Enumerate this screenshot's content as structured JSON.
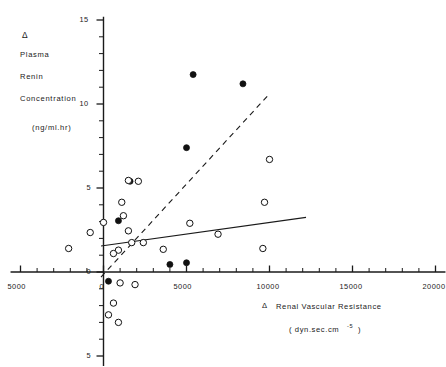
{
  "figure": {
    "background": "#ffffff",
    "ink": "#1a1a1a",
    "y_axis_title_lines": [
      "Δ",
      "Plasma",
      "Renin",
      "Concentration"
    ],
    "y_axis_units": "(ng/ml.hr)",
    "x_axis_title_symbol": "Δ",
    "x_axis_title": "Renal Vascular Resistance",
    "x_axis_units_prefix": "( dyn.sec.cm",
    "x_axis_units_exponent": "-5",
    "x_axis_units_suffix": ")"
  },
  "chart_data": {
    "type": "scatter",
    "title": "",
    "xlabel": "Δ Renal Vascular Resistance ( dyn.sec.cm -5 )",
    "ylabel": "Δ Plasma Renin Concentration (ng/ml.hr)",
    "xlim": [
      -5600,
      20600
    ],
    "ylim": [
      -5.6,
      15.2
    ],
    "grid": false,
    "legend": "none",
    "x_ticks": [
      -5000,
      0,
      5000,
      10000,
      15000,
      20000
    ],
    "x_tick_labels": [
      "5000",
      "0",
      "5000",
      "10000",
      "15000",
      "20000"
    ],
    "x_minor_tick_step": 1000,
    "y_ticks": [
      -5,
      0,
      5,
      10,
      15
    ],
    "y_tick_labels": [
      "5",
      "0",
      "5",
      "10",
      "15"
    ],
    "y_minor_tick_step": 1,
    "series": [
      {
        "name": "filled",
        "marker": "filled-circle",
        "color": "#111111",
        "points": [
          [
            5400,
            11.75
          ],
          [
            8400,
            11.2
          ],
          [
            5000,
            7.4
          ],
          [
            1600,
            5.4
          ],
          [
            900,
            3.05
          ],
          [
            300,
            -0.55
          ],
          [
            4000,
            0.45
          ],
          [
            5000,
            0.55
          ]
        ]
      },
      {
        "name": "open",
        "marker": "open-circle",
        "color": "#111111",
        "points": [
          [
            -2100,
            1.4
          ],
          [
            -800,
            2.35
          ],
          [
            0,
            2.95
          ],
          [
            1500,
            5.45
          ],
          [
            2100,
            5.4
          ],
          [
            1100,
            4.15
          ],
          [
            1200,
            3.35
          ],
          [
            1500,
            2.45
          ],
          [
            1700,
            1.75
          ],
          [
            900,
            1.3
          ],
          [
            600,
            1.1
          ],
          [
            2400,
            1.75
          ],
          [
            3600,
            1.35
          ],
          [
            5200,
            2.9
          ],
          [
            6900,
            2.25
          ],
          [
            10000,
            6.7
          ],
          [
            9700,
            4.15
          ],
          [
            9600,
            1.4
          ],
          [
            1000,
            -0.65
          ],
          [
            1900,
            -0.75
          ],
          [
            600,
            -1.85
          ],
          [
            300,
            -2.55
          ],
          [
            900,
            -3.0
          ]
        ]
      }
    ],
    "fit_lines": [
      {
        "name": "dashed-fit",
        "style": "dashed",
        "x0": -150,
        "y0": -0.3,
        "x1": 9900,
        "y1": 10.5
      },
      {
        "name": "solid-fit",
        "style": "solid",
        "x0": -150,
        "y0": 1.55,
        "x1": 12200,
        "y1": 3.25
      }
    ]
  }
}
